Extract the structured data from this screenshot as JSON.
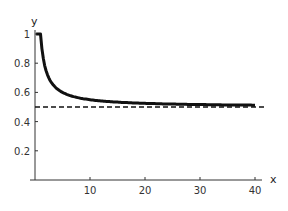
{
  "chart_data": {
    "type": "line",
    "title": "",
    "xlabel": "x",
    "ylabel": "y",
    "xlim": [
      0,
      40
    ],
    "ylim": [
      0,
      1
    ],
    "x_ticks": [
      10,
      20,
      30,
      40
    ],
    "y_ticks": [
      0.2,
      0.4,
      0.6,
      0.8,
      1
    ],
    "x_tick_labels": [
      "10",
      "20",
      "30",
      "40"
    ],
    "y_tick_labels": [
      "0.2",
      "0.4",
      "0.6",
      "0.8",
      "1"
    ],
    "grid": false,
    "legend": null,
    "series": [
      {
        "name": "curve",
        "style": "solid-thick",
        "x": [
          1,
          1.5,
          2,
          2.5,
          3,
          4,
          5,
          6,
          8,
          10,
          12,
          15,
          20,
          25,
          30,
          35,
          40
        ],
        "y": [
          1.0,
          0.833,
          0.75,
          0.7,
          0.667,
          0.625,
          0.6,
          0.583,
          0.563,
          0.55,
          0.542,
          0.533,
          0.525,
          0.52,
          0.517,
          0.514,
          0.513
        ]
      },
      {
        "name": "asymptote",
        "style": "dashed",
        "x": [
          0,
          42
        ],
        "y": [
          0.5,
          0.5
        ]
      }
    ]
  }
}
